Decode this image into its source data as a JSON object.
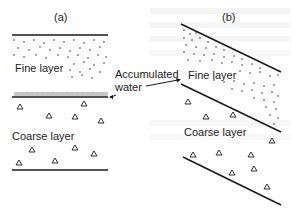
{
  "figure": {
    "panel_a": {
      "label": "(a)",
      "fine_layer_label": "Fine layer",
      "coarse_layer_label": "Coarse layer"
    },
    "panel_b": {
      "label": "(b)",
      "fine_layer_label": "Fine layer",
      "coarse_layer_label": "Coarse layer"
    },
    "annotation": {
      "line1": "Accumulated",
      "line2": "water"
    },
    "symbols": {
      "fine_particle": "dot",
      "coarse_particle": "triangle-icon"
    },
    "colors": {
      "ink": "#1a1a1a",
      "background": "#ffffff"
    }
  }
}
